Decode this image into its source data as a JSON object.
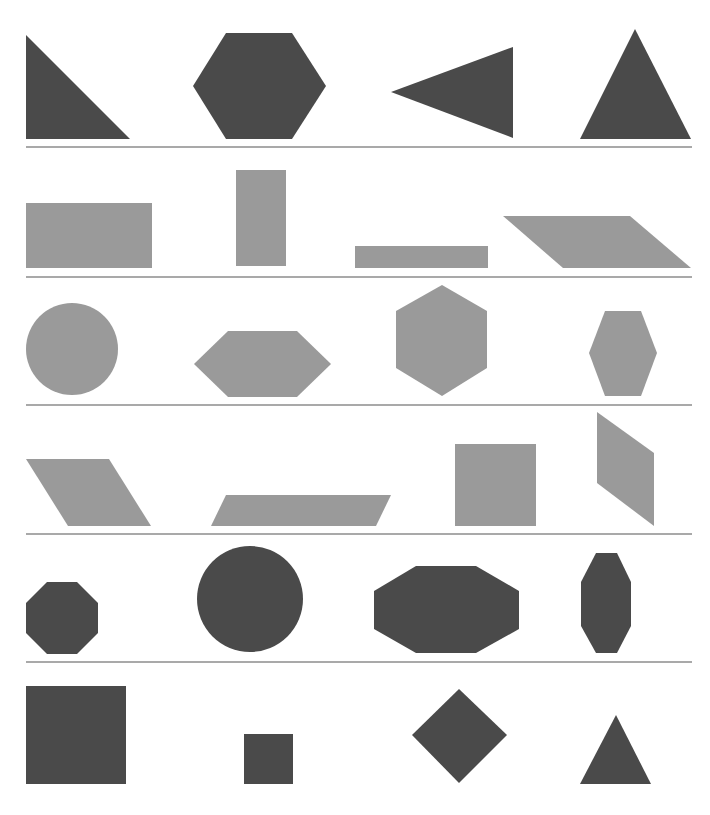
{
  "colors": {
    "dark": "#4a4a4a",
    "light": "#9a9a9a",
    "divider": "#555555",
    "background": "#ffffff"
  },
  "dividers": [
    147,
    277,
    405,
    534,
    662
  ],
  "rows": [
    {
      "fill": "dark",
      "shapes": [
        {
          "name": "right-triangle",
          "type": "polygon",
          "points": "26,35 26,139 130,139"
        },
        {
          "name": "hexagon",
          "type": "polygon",
          "points": "226,33 292,33 326,86 292,139 226,139 193,86"
        },
        {
          "name": "left-pointing-triangle",
          "type": "polygon",
          "points": "391,92 513,47 513,138"
        },
        {
          "name": "equilateral-triangle",
          "type": "polygon",
          "points": "635,29 691,139 580,139"
        }
      ]
    },
    {
      "fill": "light",
      "shapes": [
        {
          "name": "wide-rectangle",
          "type": "polygon",
          "points": "26,203 152,203 152,268 26,268"
        },
        {
          "name": "tall-rectangle",
          "type": "polygon",
          "points": "236,170 286,170 286,266 236,266"
        },
        {
          "name": "thin-rectangle",
          "type": "polygon",
          "points": "355,246 488,246 488,268 355,268"
        },
        {
          "name": "parallelogram",
          "type": "polygon",
          "points": "503,216 630,216 691,268 563,268"
        }
      ]
    },
    {
      "fill": "light",
      "shapes": [
        {
          "name": "circle",
          "type": "circle",
          "cx": 72,
          "cy": 349,
          "r": 46
        },
        {
          "name": "flat-hexagon",
          "type": "polygon",
          "points": "228,331 297,331 331,364 297,397 228,397 194,364"
        },
        {
          "name": "pointy-hexagon",
          "type": "polygon",
          "points": "442,285 487,311 487,368 442,396 396,368 396,311"
        },
        {
          "name": "small-hexagon",
          "type": "polygon",
          "points": "605,311 641,311 657,353 641,396 605,396 589,353"
        }
      ]
    },
    {
      "fill": "light",
      "shapes": [
        {
          "name": "slanted-parallelogram",
          "type": "polygon",
          "points": "26,459 109,459 151,526 68,526"
        },
        {
          "name": "flat-parallelogram",
          "type": "polygon",
          "points": "226,495 391,495 376,526 211,526"
        },
        {
          "name": "square",
          "type": "polygon",
          "points": "455,444 536,444 536,526 455,526"
        },
        {
          "name": "vertical-parallelogram",
          "type": "polygon",
          "points": "597,412 654,453 654,526 597,483"
        }
      ]
    },
    {
      "fill": "dark",
      "shapes": [
        {
          "name": "octagon",
          "type": "polygon",
          "points": "47,582 77,582 98,603 98,633 77,654 47,654 26,633 26,603"
        },
        {
          "name": "large-circle",
          "type": "circle",
          "cx": 250,
          "cy": 599,
          "r": 53
        },
        {
          "name": "wide-octagon",
          "type": "polygon",
          "points": "416,566 476,566 519,591 519,629 476,653 416,653 374,629 374,591"
        },
        {
          "name": "tall-octagon",
          "type": "polygon",
          "points": "596,553 617,553 631,582 631,626 617,653 596,653 581,626 581,582"
        }
      ]
    },
    {
      "fill": "dark",
      "shapes": [
        {
          "name": "large-square",
          "type": "polygon",
          "points": "26,686 126,686 126,784 26,784"
        },
        {
          "name": "small-square",
          "type": "polygon",
          "points": "244,734 293,734 293,784 244,784"
        },
        {
          "name": "diamond",
          "type": "polygon",
          "points": "459,689 507,735 459,783 412,735"
        },
        {
          "name": "small-triangle",
          "type": "polygon",
          "points": "616,715 651,784 580,784"
        }
      ]
    }
  ]
}
